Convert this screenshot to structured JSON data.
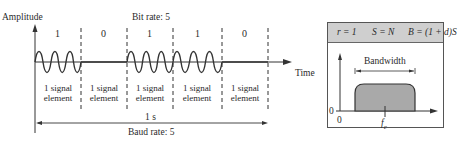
{
  "left_diagram": {
    "y_axis_label": "Amplitude",
    "x_axis_label": "Time",
    "bit_rate_label": "Bit rate: 5",
    "bits": [
      "1",
      "0",
      "1",
      "1",
      "0"
    ],
    "signal_elements": [
      {
        "line1": "1 signal",
        "line2": "element"
      },
      {
        "line1": "1 signal",
        "line2": "element"
      },
      {
        "line1": "1 signal",
        "line2": "element"
      },
      {
        "line1": "1 signal",
        "line2": "element"
      },
      {
        "line1": "1 signal",
        "line2": "element"
      }
    ],
    "duration_label": "1 s",
    "baud_rate_label": "Baud rate: 5"
  },
  "right_panel": {
    "formulas": {
      "r": "r = 1",
      "s": "S = N",
      "b": "B = (1 + d)S"
    },
    "bandwidth_label": "Bandwidth",
    "y_zero_label": "0",
    "x_zero_label": "0",
    "fc_label": "f",
    "fc_subscript": "c"
  },
  "colors": {
    "stroke": "#333333",
    "panel_header": "#cfcfcf",
    "spectrum_fill": "#a9a9a9"
  }
}
